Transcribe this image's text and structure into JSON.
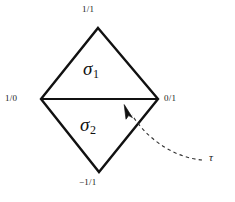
{
  "figure": {
    "kind": "farey-diamond-diagram",
    "background_color": "#ffffff",
    "stroke_color": "#111111",
    "dash_color": "#333333",
    "vertices": {
      "top": {
        "label": "1/1",
        "x": 98,
        "y": 28
      },
      "left": {
        "label": "1/0",
        "x": 41,
        "y": 99
      },
      "right": {
        "label": "0/1",
        "x": 158,
        "y": 99
      },
      "bottom": {
        "label": "−1/1",
        "x": 99,
        "y": 172
      }
    },
    "cells": [
      {
        "name": "upper-triangle",
        "symbol": "σ",
        "subscript": "1"
      },
      {
        "name": "lower-triangle",
        "symbol": "σ",
        "subscript": "2"
      }
    ],
    "annotation": {
      "label": "τ",
      "target": "horizontal-diagonal-edge",
      "arrow_tip": {
        "x": 126,
        "y": 107
      },
      "curve_end": {
        "x": 202,
        "y": 160
      },
      "style": "dashed"
    },
    "edges": {
      "diagonal": {
        "from": "left",
        "to": "right",
        "width": 2.2
      },
      "outline_width": 2.4
    }
  }
}
